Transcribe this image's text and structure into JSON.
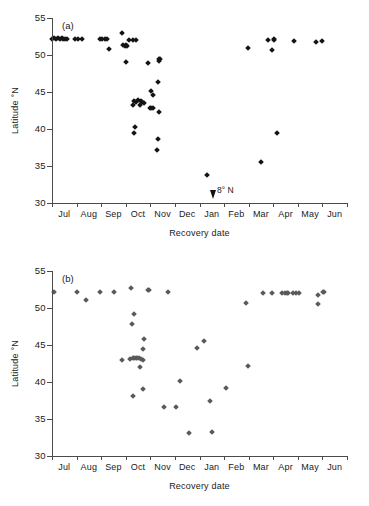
{
  "figure": {
    "background_color": "#ffffff",
    "axis_color": "#4a4a4a"
  },
  "chart_data": [
    {
      "type": "scatter",
      "panel": "(a)",
      "title": "",
      "xlabel": "Recovery date",
      "ylabel": "Latitude °N",
      "marker_color": "#141414",
      "marker_shape": "diamond",
      "grid": false,
      "legend": "none",
      "ylim": [
        30,
        55
      ],
      "yticks": [
        30,
        35,
        40,
        45,
        50,
        55
      ],
      "categories": [
        "Jul",
        "Aug",
        "Sep",
        "Oct",
        "Nov",
        "Dec",
        "Jan",
        "Feb",
        "Mar",
        "Apr",
        "May",
        "Jun"
      ],
      "xlim": [
        0,
        12
      ],
      "annotations": [
        {
          "text": "8° N",
          "x": 6.55,
          "y": 31.6,
          "arrow": "down"
        }
      ],
      "points": [
        {
          "x": 0.02,
          "y": 52.2
        },
        {
          "x": 0.1,
          "y": 52.3
        },
        {
          "x": 0.17,
          "y": 52.2
        },
        {
          "x": 0.24,
          "y": 52.3
        },
        {
          "x": 0.33,
          "y": 52.2
        },
        {
          "x": 0.4,
          "y": 52.3
        },
        {
          "x": 0.46,
          "y": 52.2
        },
        {
          "x": 0.52,
          "y": 52.2
        },
        {
          "x": 0.6,
          "y": 52.2
        },
        {
          "x": 0.95,
          "y": 52.2
        },
        {
          "x": 1.05,
          "y": 52.2
        },
        {
          "x": 1.22,
          "y": 52.2
        },
        {
          "x": 1.95,
          "y": 52.1
        },
        {
          "x": 2.05,
          "y": 52.1
        },
        {
          "x": 2.14,
          "y": 52.2
        },
        {
          "x": 2.22,
          "y": 52.1
        },
        {
          "x": 2.3,
          "y": 50.8
        },
        {
          "x": 2.84,
          "y": 53.0
        },
        {
          "x": 2.88,
          "y": 51.3
        },
        {
          "x": 2.96,
          "y": 51.2
        },
        {
          "x": 3.02,
          "y": 51.3
        },
        {
          "x": 3.06,
          "y": 51.2
        },
        {
          "x": 3.14,
          "y": 52.0
        },
        {
          "x": 3.28,
          "y": 52.0
        },
        {
          "x": 3.4,
          "y": 52.0
        },
        {
          "x": 3.02,
          "y": 49.1
        },
        {
          "x": 3.28,
          "y": 43.3
        },
        {
          "x": 3.33,
          "y": 43.8
        },
        {
          "x": 3.4,
          "y": 43.7
        },
        {
          "x": 3.5,
          "y": 43.9
        },
        {
          "x": 3.56,
          "y": 43.3
        },
        {
          "x": 3.62,
          "y": 43.8
        },
        {
          "x": 3.68,
          "y": 43.6
        },
        {
          "x": 3.74,
          "y": 43.5
        },
        {
          "x": 3.36,
          "y": 40.3
        },
        {
          "x": 3.33,
          "y": 39.4
        },
        {
          "x": 3.9,
          "y": 48.9
        },
        {
          "x": 4.02,
          "y": 45.2
        },
        {
          "x": 4.1,
          "y": 44.6
        },
        {
          "x": 3.98,
          "y": 42.9
        },
        {
          "x": 4.04,
          "y": 42.8
        },
        {
          "x": 4.1,
          "y": 42.8
        },
        {
          "x": 4.34,
          "y": 49.4
        },
        {
          "x": 4.36,
          "y": 49.2
        },
        {
          "x": 4.38,
          "y": 49.5
        },
        {
          "x": 4.32,
          "y": 46.4
        },
        {
          "x": 4.36,
          "y": 42.3
        },
        {
          "x": 4.3,
          "y": 38.7
        },
        {
          "x": 4.28,
          "y": 37.2
        },
        {
          "x": 6.3,
          "y": 33.8
        },
        {
          "x": 7.96,
          "y": 51.0
        },
        {
          "x": 8.78,
          "y": 52.0
        },
        {
          "x": 8.95,
          "y": 50.7
        },
        {
          "x": 9.02,
          "y": 52.2
        },
        {
          "x": 9.04,
          "y": 52.0
        },
        {
          "x": 8.52,
          "y": 35.5
        },
        {
          "x": 9.14,
          "y": 39.5
        },
        {
          "x": 9.84,
          "y": 51.9
        },
        {
          "x": 10.72,
          "y": 51.8
        },
        {
          "x": 11.0,
          "y": 51.9
        }
      ]
    },
    {
      "type": "scatter",
      "panel": "(b)",
      "title": "",
      "xlabel": "Recovery date",
      "ylabel": "Latitude °N",
      "marker_color": "#5a5a5a",
      "marker_shape": "diamond",
      "grid": false,
      "legend": "none",
      "ylim": [
        30,
        55
      ],
      "yticks": [
        30,
        35,
        40,
        45,
        50,
        55
      ],
      "categories": [
        "Jul",
        "Aug",
        "Sep",
        "Oct",
        "Nov",
        "Dec",
        "Jan",
        "Feb",
        "Mar",
        "Apr",
        "May",
        "Jun"
      ],
      "xlim": [
        0,
        12
      ],
      "annotations": [],
      "points": [
        {
          "x": 0.1,
          "y": 52.2
        },
        {
          "x": 1.0,
          "y": 52.2
        },
        {
          "x": 1.4,
          "y": 51.1
        },
        {
          "x": 1.95,
          "y": 52.1
        },
        {
          "x": 2.52,
          "y": 52.1
        },
        {
          "x": 3.2,
          "y": 52.7
        },
        {
          "x": 3.9,
          "y": 52.5
        },
        {
          "x": 3.96,
          "y": 52.5
        },
        {
          "x": 4.7,
          "y": 52.1
        },
        {
          "x": 3.32,
          "y": 49.2
        },
        {
          "x": 3.24,
          "y": 47.8
        },
        {
          "x": 3.74,
          "y": 45.8
        },
        {
          "x": 3.72,
          "y": 44.4
        },
        {
          "x": 2.84,
          "y": 43.0
        },
        {
          "x": 3.18,
          "y": 43.1
        },
        {
          "x": 3.28,
          "y": 43.2
        },
        {
          "x": 3.34,
          "y": 43.3
        },
        {
          "x": 3.4,
          "y": 43.3
        },
        {
          "x": 3.46,
          "y": 43.2
        },
        {
          "x": 3.54,
          "y": 43.2
        },
        {
          "x": 3.64,
          "y": 43.1
        },
        {
          "x": 3.7,
          "y": 43.0
        },
        {
          "x": 3.58,
          "y": 42.0
        },
        {
          "x": 3.7,
          "y": 39.0
        },
        {
          "x": 3.3,
          "y": 38.1
        },
        {
          "x": 4.54,
          "y": 36.6
        },
        {
          "x": 5.06,
          "y": 36.6
        },
        {
          "x": 5.2,
          "y": 40.2
        },
        {
          "x": 5.56,
          "y": 33.1
        },
        {
          "x": 5.9,
          "y": 44.6
        },
        {
          "x": 6.2,
          "y": 45.5
        },
        {
          "x": 6.5,
          "y": 33.3
        },
        {
          "x": 6.42,
          "y": 37.4
        },
        {
          "x": 7.06,
          "y": 39.2
        },
        {
          "x": 7.9,
          "y": 50.7
        },
        {
          "x": 7.96,
          "y": 42.2
        },
        {
          "x": 8.6,
          "y": 52.0
        },
        {
          "x": 8.96,
          "y": 52.0
        },
        {
          "x": 9.36,
          "y": 52.0
        },
        {
          "x": 9.46,
          "y": 52.0
        },
        {
          "x": 9.54,
          "y": 52.0
        },
        {
          "x": 9.62,
          "y": 52.0
        },
        {
          "x": 9.8,
          "y": 52.0
        },
        {
          "x": 9.94,
          "y": 52.0
        },
        {
          "x": 10.06,
          "y": 52.0
        },
        {
          "x": 10.84,
          "y": 51.8
        },
        {
          "x": 10.8,
          "y": 50.6
        },
        {
          "x": 11.02,
          "y": 52.2
        },
        {
          "x": 11.08,
          "y": 52.1
        }
      ]
    }
  ]
}
